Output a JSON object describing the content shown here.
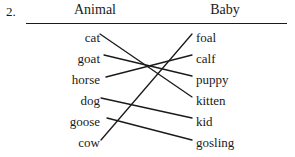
{
  "question": {
    "number": "2."
  },
  "headers": {
    "left": "Animal",
    "right": "Baby"
  },
  "columns": {
    "left": [
      {
        "label": "cat",
        "y": 37
      },
      {
        "label": "goat",
        "y": 58
      },
      {
        "label": "horse",
        "y": 79
      },
      {
        "label": "dog",
        "y": 100
      },
      {
        "label": "goose",
        "y": 121
      },
      {
        "label": "cow",
        "y": 142
      }
    ],
    "right": [
      {
        "label": "foal",
        "y": 37
      },
      {
        "label": "calf",
        "y": 58
      },
      {
        "label": "puppy",
        "y": 79
      },
      {
        "label": "kitten",
        "y": 100
      },
      {
        "label": "kid",
        "y": 121
      },
      {
        "label": "gosling",
        "y": 142
      }
    ]
  },
  "matches": [
    {
      "from": "cat",
      "to": "kitten",
      "x1": 100,
      "y1": 34,
      "x2": 192,
      "y2": 97
    },
    {
      "from": "goat",
      "to": "puppy",
      "x1": 104,
      "y1": 55,
      "x2": 192,
      "y2": 76
    },
    {
      "from": "horse",
      "to": "calf",
      "x1": 106,
      "y1": 77,
      "x2": 192,
      "y2": 55
    },
    {
      "from": "dog",
      "to": "kid",
      "x1": 101,
      "y1": 98,
      "x2": 192,
      "y2": 118
    },
    {
      "from": "goose",
      "to": "gosling",
      "x1": 107,
      "y1": 118,
      "x2": 192,
      "y2": 140
    },
    {
      "from": "cow",
      "to": "foal",
      "x1": 101,
      "y1": 140,
      "x2": 192,
      "y2": 34
    }
  ],
  "style": {
    "line_color": "#1a1a1a",
    "text_color": "#1a1a1a",
    "background": "#ffffff"
  }
}
